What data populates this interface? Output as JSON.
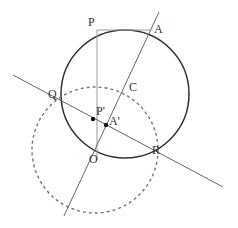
{
  "figure": {
    "labels": {
      "P": "P",
      "A": "A",
      "C": "C",
      "Q": "Q",
      "P_prime": "P'",
      "A_prime": "A'",
      "O": "O",
      "R": "R"
    },
    "colors": {
      "stroke": "#333333",
      "line": "#666666",
      "light_line": "#999999",
      "dashed": "#777777",
      "background": "#ffffff"
    }
  }
}
